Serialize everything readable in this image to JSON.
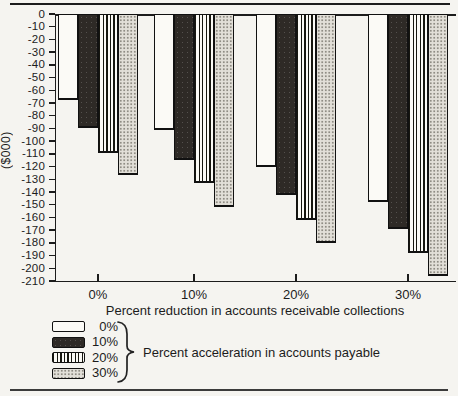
{
  "colors": {
    "paper": "#f5f4f0",
    "ink": "#1c1c1c",
    "dark_bar_fill": "#2e2a26",
    "dotted_bar_fill": "#e2dfd8"
  },
  "chart_data": {
    "type": "bar",
    "orientation": "vertical-negative",
    "title": "",
    "xlabel": "Percent reduction in accounts receivable collections",
    "ylabel": "($000)",
    "legend_title": "Percent acceleration in accounts payable",
    "legend_position": "bottom-left",
    "grid": false,
    "ylim": [
      -210,
      0
    ],
    "y_tick_step": 10,
    "y_tick_labels": [
      "0",
      "-10",
      "-20",
      "-30",
      "-40",
      "-50",
      "-60",
      "-70",
      "-80",
      "-90",
      "-100",
      "-110",
      "-120",
      "-130",
      "-140",
      "-150",
      "-160",
      "-170",
      "-180",
      "-190",
      "-200",
      "-210"
    ],
    "categories": [
      "0%",
      "10%",
      "20%",
      "30%"
    ],
    "series": [
      {
        "name": "0%",
        "pattern": "plain",
        "values": [
          -68,
          -91,
          -120,
          -148
        ]
      },
      {
        "name": "10%",
        "pattern": "solid-dark",
        "values": [
          -90,
          -115,
          -142,
          -169
        ]
      },
      {
        "name": "20%",
        "pattern": "vertical-stripes",
        "values": [
          -109,
          -133,
          -162,
          -188
        ]
      },
      {
        "name": "30%",
        "pattern": "dots",
        "values": [
          -127,
          -152,
          -180,
          -206
        ]
      }
    ]
  }
}
